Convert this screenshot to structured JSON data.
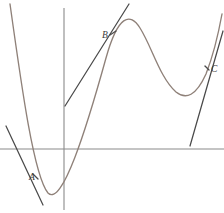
{
  "figure": {
    "background_color": "#ffffff",
    "width": 224,
    "height": 213,
    "axes": {
      "x_axis": {
        "name": "x-axis",
        "y": 149,
        "x_start": 0,
        "x_end": 224,
        "color": "#8a8a8a"
      },
      "y_axis": {
        "name": "y-axis",
        "x": 64,
        "y_start": 8,
        "y_end": 210,
        "color": "#8a8a8a"
      }
    },
    "curve": {
      "color": "#8f8179",
      "description": "cubic-like wave: steep descent from upper-left to a low minimum, rise to a local maximum, dip to a second local minimum, then a steep rise off the upper-right",
      "path": "M 10,4 C 22,90 34,176 48,193 C 62,207 86,130 106,58 C 118,15 130,12 140,28 C 152,47 160,78 176,92 C 186,100 196,96 206,74 C 213,56 218,36 222,14"
    },
    "tangents": [
      {
        "name": "tangent-at-A",
        "color": "#4a4a4a",
        "x1": 6,
        "y1": 126,
        "x2": 43,
        "y2": 205
      },
      {
        "name": "tangent-at-B",
        "color": "#4a4a4a",
        "x1": 65,
        "y1": 106,
        "x2": 129,
        "y2": 4
      },
      {
        "name": "tangent-at-C",
        "color": "#4a4a4a",
        "x1": 190,
        "y1": 146,
        "x2": 223,
        "y2": 31
      }
    ],
    "points": [
      {
        "label": "A",
        "name": "point-label-a",
        "x": 29,
        "y": 180,
        "tick_x1": 33,
        "tick_y1": 174,
        "tick_x2": 38,
        "tick_y2": 179
      },
      {
        "label": "B",
        "name": "point-label-b",
        "x": 102,
        "y": 38,
        "tick_x1": 110,
        "tick_y1": 35,
        "tick_x2": 116,
        "tick_y2": 31
      },
      {
        "label": "C",
        "name": "point-label-c",
        "x": 211,
        "y": 72,
        "tick_x1": 205,
        "tick_y1": 66,
        "tick_x2": 209,
        "tick_y2": 70
      }
    ]
  }
}
